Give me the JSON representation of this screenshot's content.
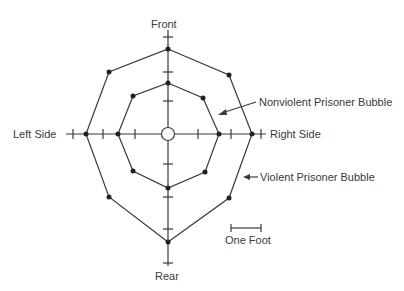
{
  "diagram": {
    "axis_labels": {
      "front": "Front",
      "rear": "Rear",
      "left": "Left Side",
      "right": "Right Side"
    },
    "callouts": {
      "nonviolent": "Nonviolent Prisoner Bubble",
      "violent": "Violent Prisoner Bubble"
    },
    "scale_label": "One Foot",
    "center_marker": "person-circle",
    "colors": {
      "line": "#3a3a3a",
      "background": "#ffffff"
    },
    "inner_octagon_points": [
      [
        168,
        83
      ],
      [
        203,
        98
      ],
      [
        219,
        134
      ],
      [
        205,
        172
      ],
      [
        168,
        188
      ],
      [
        133,
        171
      ],
      [
        118,
        134
      ],
      [
        133,
        96
      ]
    ],
    "outer_octagon_points": [
      [
        168,
        49
      ],
      [
        229,
        75
      ],
      [
        252,
        134
      ],
      [
        229,
        198
      ],
      [
        168,
        242
      ],
      [
        109,
        197
      ],
      [
        86,
        134
      ],
      [
        109,
        72
      ]
    ]
  }
}
